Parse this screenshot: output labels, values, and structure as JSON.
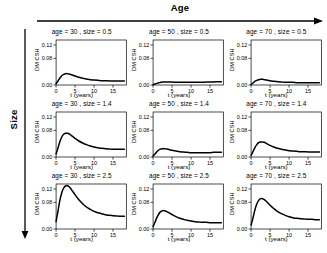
{
  "figure": {
    "top_annotation": {
      "label": "Age",
      "icon": "arrow-right-icon"
    },
    "left_annotation": {
      "label": "Size",
      "icon": "arrow-down-icon"
    }
  },
  "axes": {
    "ylabel": "DM CSH",
    "xlabel": "t (years)",
    "ytick_labels": [
      "0.00",
      "0.08",
      "0.12"
    ],
    "ytick_values": [
      0.0,
      0.08,
      0.12
    ],
    "xtick_labels": [
      "0",
      "5",
      "10",
      "15"
    ],
    "xtick_values": [
      0,
      5,
      10,
      15
    ]
  },
  "panels": [
    {
      "strip": "age =  30 , size =  0.5",
      "age": 30,
      "size": 0.5
    },
    {
      "strip": "age =  50 , size =  0.5",
      "age": 50,
      "size": 0.5
    },
    {
      "strip": "age =  70 , size =  0.5",
      "age": 70,
      "size": 0.5
    },
    {
      "strip": "age =  30 , size =  1.4",
      "age": 30,
      "size": 1.4
    },
    {
      "strip": "age =  50 , size =  1.4",
      "age": 50,
      "size": 1.4
    },
    {
      "strip": "age =  70 , size =  1.4",
      "age": 70,
      "size": 1.4
    },
    {
      "strip": "age =  30 , size =  2.5",
      "age": 30,
      "size": 2.5
    },
    {
      "strip": "age =  50 , size =  2.5",
      "age": 50,
      "size": 2.5
    },
    {
      "strip": "age =  70 , size =  2.5",
      "age": 70,
      "size": 2.5
    }
  ],
  "chart_data": {
    "type": "line",
    "title": "",
    "subtitle": "",
    "xlabel": "t (years)",
    "ylabel": "DM CSH",
    "xlim": [
      0,
      18.5
    ],
    "ylim": [
      0.0,
      0.135
    ],
    "grid": false,
    "legend": "none",
    "layout": {
      "rows": 3,
      "cols": 3,
      "row_variable": "size",
      "row_values": [
        0.5,
        1.4,
        2.5
      ],
      "col_variable": "age",
      "col_values": [
        30,
        50,
        70
      ],
      "row_direction_label": "Size",
      "col_direction_label": "Age"
    },
    "x": [
      0,
      0.5,
      1,
      1.5,
      2,
      2.5,
      3,
      3.5,
      4,
      5,
      6,
      7,
      8,
      9,
      10,
      11,
      12,
      13,
      14,
      15,
      16,
      17,
      18
    ],
    "series": [
      {
        "name": "age = 30 , size = 0.5",
        "age": 30,
        "size": 0.5,
        "values": [
          0.004,
          0.012,
          0.021,
          0.028,
          0.032,
          0.034,
          0.034,
          0.033,
          0.031,
          0.027,
          0.023,
          0.02,
          0.018,
          0.016,
          0.015,
          0.014,
          0.013,
          0.013,
          0.012,
          0.012,
          0.012,
          0.012,
          0.012
        ],
        "peak": {
          "t": 2.8,
          "value": 0.034
        }
      },
      {
        "name": "age = 50 , size = 0.5",
        "age": 50,
        "size": 0.5,
        "values": [
          0.001,
          0.003,
          0.005,
          0.007,
          0.008,
          0.009,
          0.009,
          0.009,
          0.009,
          0.009,
          0.008,
          0.008,
          0.008,
          0.008,
          0.008,
          0.008,
          0.008,
          0.008,
          0.009,
          0.009,
          0.009,
          0.01,
          0.01
        ],
        "peak": {
          "t": 3.0,
          "value": 0.009
        }
      },
      {
        "name": "age = 70 , size = 0.5",
        "age": 70,
        "size": 0.5,
        "values": [
          0.002,
          0.006,
          0.011,
          0.014,
          0.016,
          0.017,
          0.017,
          0.016,
          0.015,
          0.013,
          0.011,
          0.01,
          0.009,
          0.008,
          0.008,
          0.008,
          0.007,
          0.007,
          0.007,
          0.007,
          0.007,
          0.007,
          0.007
        ],
        "peak": {
          "t": 2.7,
          "value": 0.017
        }
      },
      {
        "name": "age = 30 , size = 1.4",
        "age": 30,
        "size": 1.4,
        "values": [
          0.009,
          0.027,
          0.046,
          0.06,
          0.068,
          0.071,
          0.071,
          0.069,
          0.065,
          0.056,
          0.048,
          0.042,
          0.037,
          0.033,
          0.03,
          0.028,
          0.026,
          0.025,
          0.024,
          0.023,
          0.023,
          0.023,
          0.023
        ],
        "peak": {
          "t": 2.8,
          "value": 0.071
        }
      },
      {
        "name": "age = 50 , size = 1.4",
        "age": 50,
        "size": 1.4,
        "values": [
          0.003,
          0.009,
          0.016,
          0.021,
          0.024,
          0.025,
          0.025,
          0.024,
          0.023,
          0.02,
          0.018,
          0.016,
          0.015,
          0.014,
          0.013,
          0.013,
          0.013,
          0.013,
          0.013,
          0.013,
          0.014,
          0.014,
          0.014
        ],
        "peak": {
          "t": 2.8,
          "value": 0.025
        }
      },
      {
        "name": "age = 70 , size = 1.4",
        "age": 70,
        "size": 1.4,
        "values": [
          0.005,
          0.016,
          0.028,
          0.037,
          0.043,
          0.045,
          0.045,
          0.044,
          0.041,
          0.035,
          0.03,
          0.026,
          0.023,
          0.021,
          0.019,
          0.018,
          0.017,
          0.016,
          0.016,
          0.015,
          0.015,
          0.015,
          0.015
        ],
        "peak": {
          "t": 2.8,
          "value": 0.045
        }
      },
      {
        "name": "age = 30 , size = 2.5",
        "age": 30,
        "size": 2.5,
        "values": [
          0.022,
          0.054,
          0.086,
          0.109,
          0.123,
          0.129,
          0.13,
          0.126,
          0.119,
          0.103,
          0.088,
          0.076,
          0.066,
          0.059,
          0.053,
          0.049,
          0.046,
          0.043,
          0.041,
          0.04,
          0.039,
          0.038,
          0.038
        ],
        "peak": {
          "t": 2.9,
          "value": 0.13
        }
      },
      {
        "name": "age = 50 , size = 2.5",
        "age": 50,
        "size": 2.5,
        "values": [
          0.007,
          0.02,
          0.034,
          0.045,
          0.052,
          0.055,
          0.055,
          0.053,
          0.05,
          0.043,
          0.037,
          0.032,
          0.029,
          0.026,
          0.024,
          0.022,
          0.021,
          0.02,
          0.02,
          0.019,
          0.019,
          0.019,
          0.019
        ],
        "peak": {
          "t": 2.8,
          "value": 0.055
        }
      },
      {
        "name": "age = 70 , size = 2.5",
        "age": 70,
        "size": 2.5,
        "values": [
          0.012,
          0.033,
          0.057,
          0.075,
          0.086,
          0.091,
          0.091,
          0.088,
          0.083,
          0.071,
          0.061,
          0.052,
          0.046,
          0.041,
          0.037,
          0.034,
          0.032,
          0.031,
          0.03,
          0.029,
          0.029,
          0.028,
          0.028
        ],
        "peak": {
          "t": 2.85,
          "value": 0.091
        }
      }
    ]
  },
  "colors": {
    "background": "#ffffff",
    "ink": "#000000",
    "curve": "#000000"
  }
}
